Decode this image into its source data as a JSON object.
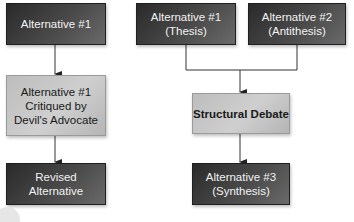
{
  "diagram": {
    "left_flow": {
      "box1": "Alternative #1",
      "box2": "Alternative #1\nCritiqued by\nDevil's Advocate",
      "box3": "Revised\nAlternative"
    },
    "right_flow": {
      "thesis": "Alternative #1\n(Thesis)",
      "antithesis": "Alternative #2\n(Antithesis)",
      "debate": "Structural Debate",
      "synthesis": "Alternative #3\n(Synthesis)"
    },
    "colors": {
      "dark_box": "#3a3a3a",
      "light_box": "#c4c4c4",
      "connector": "#333333"
    }
  }
}
